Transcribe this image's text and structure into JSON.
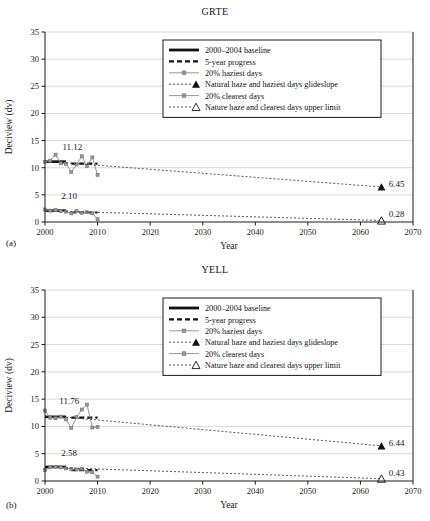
{
  "figure": {
    "panels": [
      {
        "panel_label": "(a)",
        "title": "GRTE",
        "chart_data": {
          "type": "line",
          "title": "GRTE",
          "xlabel": "Year",
          "ylabel": "Deciview (dv)",
          "xlim": [
            2000,
            2070
          ],
          "ylim": [
            0,
            35
          ],
          "xticks": [
            2000,
            2010,
            2020,
            2030,
            2040,
            2050,
            2060,
            2070
          ],
          "yticks": [
            0,
            5,
            10,
            15,
            20,
            25,
            30,
            35
          ],
          "grid": true,
          "legend_position": "upper-center",
          "annotations": [
            {
              "text": "11.12",
              "x": 2005.2,
              "y": 13.2
            },
            {
              "text": "2.10",
              "x": 2004.6,
              "y": 4.2
            },
            {
              "text": "6.45",
              "x": 2065.4,
              "y": 6.45
            },
            {
              "text": "0.28",
              "x": 2065.4,
              "y": 0.9
            }
          ],
          "series": [
            {
              "name": "2000-2004 baseline (haziest)",
              "style": "baseline",
              "x": [
                2000,
                2004
              ],
              "values": [
                11.12,
                11.12
              ]
            },
            {
              "name": "2000-2004 baseline (clearest)",
              "style": "baseline",
              "x": [
                2000,
                2004
              ],
              "values": [
                2.1,
                2.1
              ]
            },
            {
              "name": "5-year progress (haziest)",
              "style": "progress",
              "x": [
                2005,
                2010
              ],
              "values": [
                10.75,
                10.75
              ]
            },
            {
              "name": "5-year progress (clearest)",
              "style": "progress",
              "x": [
                2005,
                2010
              ],
              "values": [
                1.75,
                1.75
              ]
            },
            {
              "name": "20% haziest days",
              "style": "haziest",
              "x": [
                2000,
                2001,
                2002,
                2003,
                2004,
                2005,
                2006,
                2007,
                2008,
                2009,
                2010
              ],
              "values": [
                11.1,
                11.3,
                12.4,
                10.8,
                10.7,
                9.2,
                10.6,
                12.1,
                10.3,
                11.9,
                8.7
              ]
            },
            {
              "name": "20% clearest days",
              "style": "clearest",
              "x": [
                2000,
                2001,
                2002,
                2003,
                2004,
                2005,
                2006,
                2007,
                2008,
                2009,
                2010
              ],
              "values": [
                2.3,
                2.1,
                2.2,
                2.0,
                1.9,
                1.6,
                2.0,
                1.7,
                1.8,
                1.6,
                0.5
              ]
            },
            {
              "name": "Natural haze and haziest days glideslope",
              "style": "glideslope",
              "x": [
                2004,
                2064
              ],
              "values": [
                10.9,
                6.45
              ],
              "endpoint_marker": "filled-triangle",
              "endpoint_label": "6.45"
            },
            {
              "name": "Nature haze and clearest days upper limit",
              "style": "upperlimit",
              "x": [
                2004,
                2064
              ],
              "values": [
                1.95,
                0.28
              ],
              "endpoint_marker": "open-triangle",
              "endpoint_label": "0.28"
            }
          ],
          "legend": [
            {
              "label": "2000–2004 baseline",
              "key": "baseline"
            },
            {
              "label": "5-year progress",
              "key": "progress"
            },
            {
              "label": "20% haziest days",
              "key": "haziest"
            },
            {
              "label": "Natural haze and haziest days glideslope",
              "key": "glideslope"
            },
            {
              "label": "20% clearest days",
              "key": "clearest"
            },
            {
              "label": "Nature haze and clearest days upper limit",
              "key": "upperlimit"
            }
          ]
        }
      },
      {
        "panel_label": "(b)",
        "title": "YELL",
        "chart_data": {
          "type": "line",
          "title": "YELL",
          "xlabel": "Year",
          "ylabel": "Deciview (dv)",
          "xlim": [
            2000,
            2070
          ],
          "ylim": [
            0,
            35
          ],
          "xticks": [
            2000,
            2010,
            2020,
            2030,
            2040,
            2050,
            2060,
            2070
          ],
          "yticks": [
            0,
            5,
            10,
            15,
            20,
            25,
            30,
            35
          ],
          "grid": true,
          "legend_position": "upper-center",
          "annotations": [
            {
              "text": "11.76",
              "x": 2004.6,
              "y": 14.2
            },
            {
              "text": "2.58",
              "x": 2004.6,
              "y": 4.6
            },
            {
              "text": "6.44",
              "x": 2065.4,
              "y": 6.44
            },
            {
              "text": "0.43",
              "x": 2065.4,
              "y": 1.0
            }
          ],
          "series": [
            {
              "name": "2000-2004 baseline (haziest)",
              "style": "baseline",
              "x": [
                2000,
                2004
              ],
              "values": [
                11.76,
                11.76
              ]
            },
            {
              "name": "2000-2004 baseline (clearest)",
              "style": "baseline",
              "x": [
                2000,
                2004
              ],
              "values": [
                2.58,
                2.58
              ]
            },
            {
              "name": "5-year progress (haziest)",
              "style": "progress",
              "x": [
                2005,
                2010
              ],
              "values": [
                11.6,
                11.6
              ]
            },
            {
              "name": "5-year progress (clearest)",
              "style": "progress",
              "x": [
                2005,
                2010
              ],
              "values": [
                2.0,
                2.0
              ]
            },
            {
              "name": "20% haziest days",
              "style": "haziest",
              "x": [
                2000,
                2001,
                2002,
                2003,
                2004,
                2005,
                2006,
                2007,
                2008,
                2009,
                2010
              ],
              "values": [
                12.9,
                11.6,
                11.5,
                11.8,
                11.3,
                9.7,
                11.7,
                13.1,
                14.0,
                9.8,
                9.9
              ]
            },
            {
              "name": "20% clearest days",
              "style": "clearest",
              "x": [
                2000,
                2001,
                2002,
                2003,
                2004,
                2005,
                2006,
                2007,
                2008,
                2009,
                2010
              ],
              "values": [
                2.0,
                2.5,
                2.6,
                2.5,
                2.3,
                2.2,
                2.1,
                2.2,
                1.7,
                1.6,
                0.8
              ]
            },
            {
              "name": "Natural haze and haziest days glideslope",
              "style": "glideslope",
              "x": [
                2004,
                2064
              ],
              "values": [
                11.7,
                6.44
              ],
              "endpoint_marker": "filled-triangle",
              "endpoint_label": "6.44"
            },
            {
              "name": "Nature haze and clearest days upper limit",
              "style": "upperlimit",
              "x": [
                2004,
                2064
              ],
              "values": [
                2.4,
                0.43
              ],
              "endpoint_marker": "open-triangle",
              "endpoint_label": "0.43"
            }
          ],
          "legend": [
            {
              "label": "2000–2004 baseline",
              "key": "baseline"
            },
            {
              "label": "5-year progress",
              "key": "progress"
            },
            {
              "label": "20% haziest days",
              "key": "haziest"
            },
            {
              "label": "Natural haze and haziest days glideslope",
              "key": "glideslope"
            },
            {
              "label": "20% clearest days",
              "key": "clearest"
            },
            {
              "label": "Nature haze and clearest days upper limit",
              "key": "upperlimit"
            }
          ]
        }
      }
    ]
  }
}
